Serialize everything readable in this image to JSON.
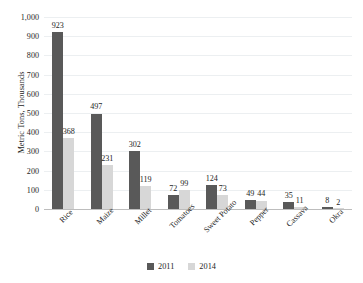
{
  "chart_data": {
    "type": "bar",
    "title": "",
    "xlabel": "",
    "ylabel": "Metric Tons, Thousands",
    "ylim": [
      0,
      1000
    ],
    "ytick_labels": [
      "1,000",
      "900",
      "800",
      "700",
      "600",
      "500",
      "400",
      "300",
      "200",
      "100",
      "0"
    ],
    "ytick_values": [
      1000,
      900,
      800,
      700,
      600,
      500,
      400,
      300,
      200,
      100,
      0
    ],
    "grid": true,
    "legend_position": "bottom-center",
    "categories": [
      "Rice",
      "Maize",
      "Millet",
      "Tomatoes",
      "Sweet Potato",
      "Pepper",
      "Cassava",
      "Okra"
    ],
    "series": [
      {
        "name": "2011",
        "color": "#595959",
        "values": [
          923,
          497,
          302,
          72,
          124,
          49,
          35,
          8
        ]
      },
      {
        "name": "2014",
        "color": "#d7d7d7",
        "values": [
          368,
          231,
          119,
          99,
          73,
          44,
          11,
          2
        ]
      }
    ],
    "data_labels": {
      "2011": [
        "923",
        "497",
        "302",
        "72",
        "124",
        "49",
        "35",
        "8"
      ],
      "2014": [
        "368",
        "231",
        "119",
        "99",
        "73",
        "44",
        "11",
        "2"
      ]
    }
  },
  "legend": {
    "items": [
      {
        "label": "2011",
        "color": "#595959"
      },
      {
        "label": "2014",
        "color": "#d7d7d7"
      }
    ]
  }
}
